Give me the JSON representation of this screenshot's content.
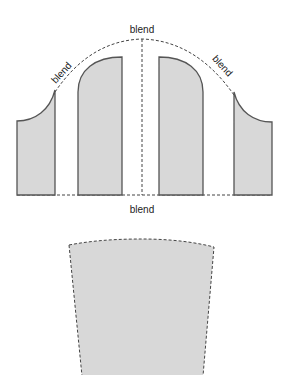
{
  "diagram": {
    "labels": {
      "top": "blend",
      "left": "blend",
      "right": "blend",
      "bottom": "blend"
    },
    "colors": {
      "fill": "#d8d8d8",
      "stroke": "#555555",
      "dash": "#444444",
      "background": "#ffffff"
    },
    "pieces": [
      {
        "name": "left-side-panel"
      },
      {
        "name": "left-center-panel"
      },
      {
        "name": "right-center-panel"
      },
      {
        "name": "right-side-panel"
      },
      {
        "name": "blended-result-panel"
      }
    ]
  }
}
